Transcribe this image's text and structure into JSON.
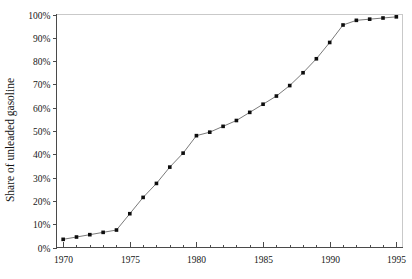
{
  "chart_data": {
    "type": "line",
    "title": "",
    "xlabel": "",
    "ylabel": "Share of unleaded gasoline",
    "xlim": [
      1969.5,
      1995.5
    ],
    "ylim": [
      0,
      100
    ],
    "grid": false,
    "legend": null,
    "x_tick_labels": [
      "1970",
      "1975",
      "1980",
      "1985",
      "1990",
      "1995"
    ],
    "x_tick_values": [
      1970,
      1975,
      1980,
      1985,
      1990,
      1995
    ],
    "x_minor_tick_interval": 1,
    "y_tick_labels": [
      "0%",
      "10%",
      "20%",
      "30%",
      "40%",
      "50%",
      "60%",
      "70%",
      "80%",
      "90%",
      "100%"
    ],
    "y_tick_values": [
      0,
      10,
      20,
      30,
      40,
      50,
      60,
      70,
      80,
      90,
      100
    ],
    "series": [
      {
        "name": "Share of unleaded gasoline",
        "marker": "square",
        "line_color": "#7a7a7a",
        "marker_color": "#0d0d0d",
        "x": [
          1970,
          1971,
          1972,
          1973,
          1974,
          1975,
          1976,
          1977,
          1978,
          1979,
          1980,
          1981,
          1982,
          1983,
          1984,
          1985,
          1986,
          1987,
          1988,
          1989,
          1990,
          1991,
          1992,
          1993,
          1994,
          1995
        ],
        "values": [
          3.5,
          4.5,
          5.5,
          6.5,
          7.5,
          14.5,
          21.5,
          27.5,
          34.5,
          40.5,
          48.0,
          49.5,
          52.0,
          54.5,
          58.0,
          61.5,
          65.0,
          69.5,
          75.0,
          81.0,
          88.0,
          95.5,
          97.5,
          98.0,
          98.5,
          99.0
        ]
      }
    ]
  },
  "axes": {
    "y_axis_title": "Share of unleaded gasoline"
  }
}
